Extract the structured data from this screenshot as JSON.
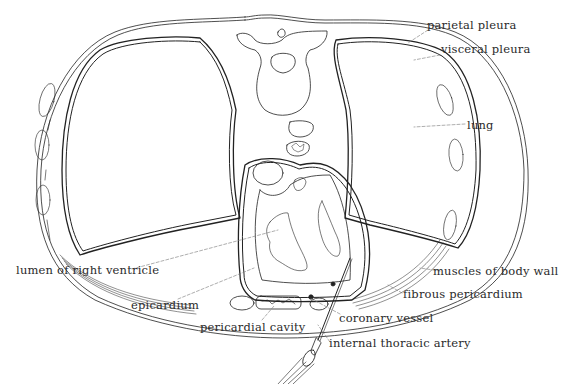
{
  "figure": {
    "colors": {
      "line": "#222222",
      "leader": "#777777",
      "text": "#2a2a2a",
      "background": "#ffffff"
    }
  },
  "labels": [
    {
      "id": "parietal-pleura",
      "text": "parietal pleura",
      "x": 427,
      "y": 24
    },
    {
      "id": "visceral-pleura",
      "text": "visceral pleura",
      "x": 441,
      "y": 49
    },
    {
      "id": "lung",
      "text": "lung",
      "x": 467,
      "y": 118
    },
    {
      "id": "lumen-of-right-ventricle",
      "text": "lumen of right ventricle",
      "x": 16,
      "y": 265
    },
    {
      "id": "muscles-of-body-wall",
      "text": "muscles of body wall",
      "x": 433,
      "y": 265
    },
    {
      "id": "fibrous-pericardium",
      "text": "fibrous pericardium",
      "x": 403,
      "y": 288
    },
    {
      "id": "epicardium",
      "text": "epicardium",
      "x": 131,
      "y": 299
    },
    {
      "id": "pericardial-cavity",
      "text": "pericardial cavity",
      "x": 200,
      "y": 322
    },
    {
      "id": "coronary-vessel",
      "text": "coronary vessel",
      "x": 339,
      "y": 312
    },
    {
      "id": "internal-thoracic-artery",
      "text": "internal thoracic artery",
      "x": 329,
      "y": 338
    }
  ]
}
